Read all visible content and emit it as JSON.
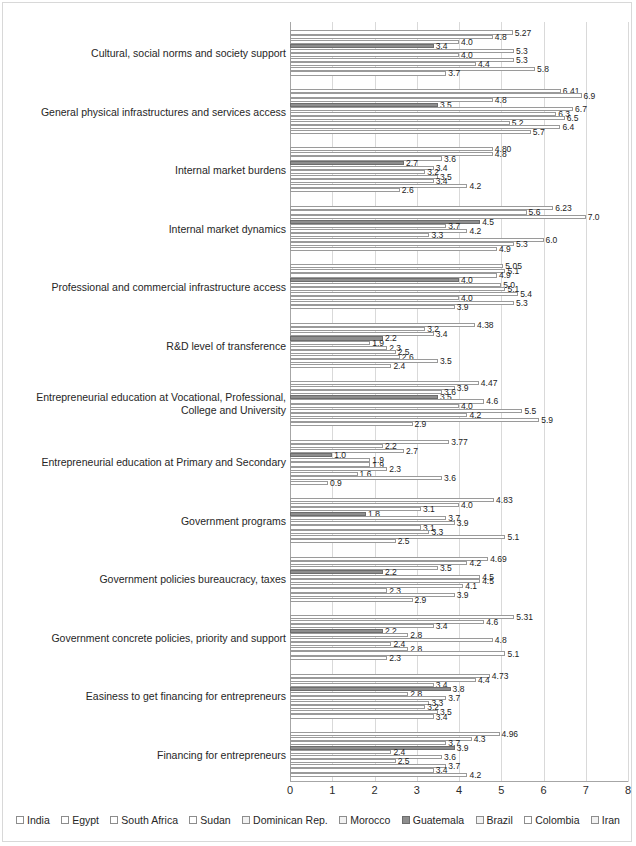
{
  "chart_data": {
    "type": "bar",
    "orientation": "horizontal",
    "title": "",
    "xlabel": "",
    "ylabel": "",
    "xlim": [
      0,
      8
    ],
    "xticks": [
      "0",
      "1",
      "2",
      "3",
      "4",
      "5",
      "6",
      "7",
      "8"
    ],
    "grid": true,
    "legend_position": "bottom",
    "categories": [
      "Cultural, social norms and society support",
      "General physical infrastructures and services access",
      "Internal market burdens",
      "Internal market dynamics",
      "Professional and commercial infrastructure access",
      "R&D level of transference",
      "Entrepreneurial education at Vocational, Professional, College and University",
      "Entrepreneurial  education at Primary and Secondary",
      "Government programs",
      "Government policies bureaucracy, taxes",
      "Government concrete policies, priority and support",
      "Easiness to get financing for entrepreneurs",
      "Financing for entrepreneurs"
    ],
    "series": [
      {
        "name": "India",
        "values": [
          3.7,
          5.7,
          2.6,
          4.9,
          3.9,
          2.4,
          2.9,
          0.9,
          2.5,
          2.9,
          2.3,
          3.4,
          4.2
        ],
        "labels": [
          "3.7",
          "5.7",
          "2.6",
          "4.9",
          "3.9",
          "2.4",
          "2.9",
          "0.9",
          "2.5",
          "2.9",
          "2.3",
          "3.4",
          "4.2"
        ]
      },
      {
        "name": "Egypt",
        "values": [
          5.8,
          6.4,
          4.2,
          5.3,
          5.3,
          3.5,
          5.9,
          3.6,
          5.1,
          3.9,
          5.1,
          3.5,
          3.4
        ],
        "labels": [
          "5.8",
          "6.4",
          "4.2",
          "5.3",
          "5.3",
          "3.5",
          "5.9",
          "3.6",
          "5.1",
          "3.9",
          "5.1",
          "3.5",
          "3.4"
        ]
      },
      {
        "name": "South Africa",
        "values": [
          4.4,
          5.2,
          3.4,
          6.0,
          4.0,
          2.6,
          4.2,
          1.6,
          3.3,
          2.3,
          2.8,
          3.2,
          3.7
        ],
        "labels": [
          "4.4",
          "5.2",
          "3.4",
          "6.0",
          "4.0",
          "2.6",
          "4.2",
          "1.6",
          "3.3",
          "2.3",
          "2.8",
          "3.2",
          "3.7"
        ]
      },
      {
        "name": "Sudan",
        "values": [
          5.3,
          6.5,
          3.5,
          3.3,
          5.4,
          2.5,
          5.5,
          2.3,
          3.1,
          4.1,
          2.4,
          3.3,
          2.5
        ],
        "labels": [
          "5.3",
          "6.5",
          "3.5",
          "3.3",
          "5.4",
          "2.5",
          "5.5",
          "2.3",
          "3.1",
          "4.1",
          "2.4",
          "3.3",
          "2.5"
        ]
      },
      {
        "name": "Dominican Rep.",
        "values": [
          4.0,
          6.3,
          3.2,
          4.2,
          5.1,
          2.3,
          4.0,
          1.9,
          3.9,
          4.5,
          4.8,
          3.7,
          3.6
        ],
        "labels": [
          "4.0",
          "6.3",
          "3.2",
          "4.2",
          "5.1",
          "2.3",
          "4.0",
          "1.9",
          "3.9",
          "4.5",
          "4.8",
          "3.7",
          "3.6"
        ]
      },
      {
        "name": "Morocco",
        "values": [
          5.3,
          6.7,
          3.4,
          3.7,
          5.0,
          1.9,
          4.6,
          1.9,
          3.7,
          4.5,
          2.8,
          2.8,
          2.4
        ],
        "labels": [
          "5.3",
          "6.7",
          "3.4",
          "3.7",
          "5.0",
          "1.9",
          "4.6",
          "1.9",
          "3.7",
          "4.5",
          "2.8",
          "2.8",
          "2.4"
        ]
      },
      {
        "name": "Guatemala",
        "values": [
          3.4,
          3.5,
          2.7,
          4.5,
          4.0,
          2.2,
          3.5,
          1.0,
          1.8,
          2.2,
          2.2,
          3.8,
          3.9
        ],
        "labels": [
          "3.4",
          "3.5",
          "2.7",
          "4.5",
          "4.0",
          "2.2",
          "3.5",
          "1.0",
          "1.8",
          "2.2",
          "2.2",
          "3.8",
          "3.9"
        ]
      },
      {
        "name": "Brazil",
        "values": [
          4.0,
          4.8,
          3.6,
          7.0,
          4.9,
          3.4,
          3.6,
          2.7,
          3.1,
          3.5,
          3.4,
          3.4,
          3.7
        ],
        "labels": [
          "4.0",
          "4.8",
          "3.6",
          "7.0",
          "4.9",
          "3.4",
          "3.6",
          "2.7",
          "3.1",
          "3.5",
          "3.4",
          "3.4",
          "3.7"
        ]
      },
      {
        "name": "Colombia",
        "values": [
          4.8,
          6.9,
          4.8,
          5.6,
          5.1,
          3.2,
          3.9,
          2.2,
          4.0,
          4.2,
          4.6,
          4.4,
          4.3
        ],
        "labels": [
          "4.8",
          "6.9",
          "4.8",
          "5.6",
          "5.1",
          "3.2",
          "3.9",
          "2.2",
          "4.0",
          "4.2",
          "4.6",
          "4.4",
          "4.3"
        ]
      },
      {
        "name": "Iran",
        "values": [
          5.27,
          6.41,
          4.8,
          6.23,
          5.05,
          4.38,
          4.47,
          3.77,
          4.83,
          4.69,
          5.31,
          4.73,
          4.96
        ],
        "labels": [
          "5.27",
          "6.41",
          "4.80",
          "6.23",
          "5.05",
          "4.38",
          "4.47",
          "3.77",
          "4.83",
          "4.69",
          "5.31",
          "4.73",
          "4.96"
        ]
      }
    ]
  },
  "legend": {
    "items": [
      {
        "label": "India",
        "style": "plain"
      },
      {
        "label": "Egypt",
        "style": "plain"
      },
      {
        "label": "South Africa",
        "style": "plain"
      },
      {
        "label": "Sudan",
        "style": "plain"
      },
      {
        "label": "Dominican Rep.",
        "style": "lgray"
      },
      {
        "label": "Morocco",
        "style": "lgray"
      },
      {
        "label": "Guatemala",
        "style": "dark"
      },
      {
        "label": "Brazil",
        "style": "lgray"
      },
      {
        "label": "Colombia",
        "style": "plain"
      },
      {
        "label": "Iran",
        "style": "lgray"
      }
    ]
  },
  "colors": {
    "bar_fill": "#ffffff",
    "bar_border": "#9a9a9a",
    "highlight_fill": "#8e8e8e",
    "gridline": "#d9d9d9",
    "axis": "#a6a6a6",
    "text": "#262626"
  }
}
